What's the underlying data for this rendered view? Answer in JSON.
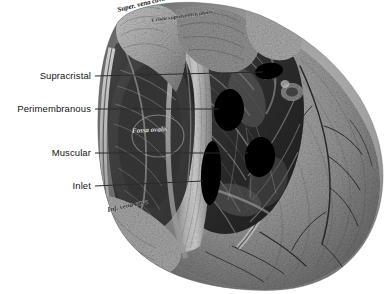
{
  "figure": {
    "width": 390,
    "height": 294,
    "background_color": "#ffffff",
    "ink_color": "#161616",
    "leader_color": "#2b2b2b",
    "marker_color": "#000000"
  },
  "annotations": [
    {
      "id": "supracristal",
      "label": "Supracristal",
      "label_x": 91,
      "label_y": 76,
      "leader_start_x": 95,
      "leader_start_y": 76,
      "leader_end_x": 263,
      "leader_end_y": 72,
      "marker": {
        "cx": 269,
        "cy": 71,
        "rx": 14,
        "ry": 8,
        "rotate": -8
      }
    },
    {
      "id": "perimembranous",
      "label": "Perimembranous",
      "label_x": 91,
      "label_y": 109,
      "leader_start_x": 95,
      "leader_start_y": 109,
      "leader_end_x": 219,
      "leader_end_y": 109,
      "marker": {
        "cx": 229,
        "cy": 110,
        "rx": 15,
        "ry": 21,
        "rotate": 4
      }
    },
    {
      "id": "muscular",
      "label": "Muscular",
      "label_x": 91,
      "label_y": 153,
      "leader_start_x": 95,
      "leader_start_y": 153,
      "leader_end_x": 248,
      "leader_end_y": 153,
      "marker": {
        "cx": 260,
        "cy": 157,
        "rx": 15,
        "ry": 20,
        "rotate": 6
      }
    },
    {
      "id": "inlet",
      "label": "Inlet",
      "label_x": 91,
      "label_y": 186,
      "leader_start_x": 95,
      "leader_start_y": 186,
      "leader_end_x": 203,
      "leader_end_y": 181,
      "marker": {
        "cx": 211,
        "cy": 173,
        "rx": 10,
        "ry": 32,
        "rotate": 3
      }
    }
  ],
  "engraved_captions": [
    {
      "id": "superior-vena-cava",
      "text": "Super. vena cava",
      "x": 118,
      "y": 12,
      "rotate": -14,
      "size": 7
    },
    {
      "id": "crista-supraventricularis",
      "text": "Crista supraventricularis",
      "x": 152,
      "y": 22,
      "rotate": -8,
      "size": 6
    },
    {
      "id": "fossa-ovalis",
      "text": "Fossa ovalis",
      "x": 132,
      "y": 133,
      "rotate": -3,
      "size": 7
    },
    {
      "id": "inferior-vena-cava",
      "text": "Inf. vena cava",
      "x": 108,
      "y": 212,
      "rotate": -12,
      "size": 7
    }
  ]
}
